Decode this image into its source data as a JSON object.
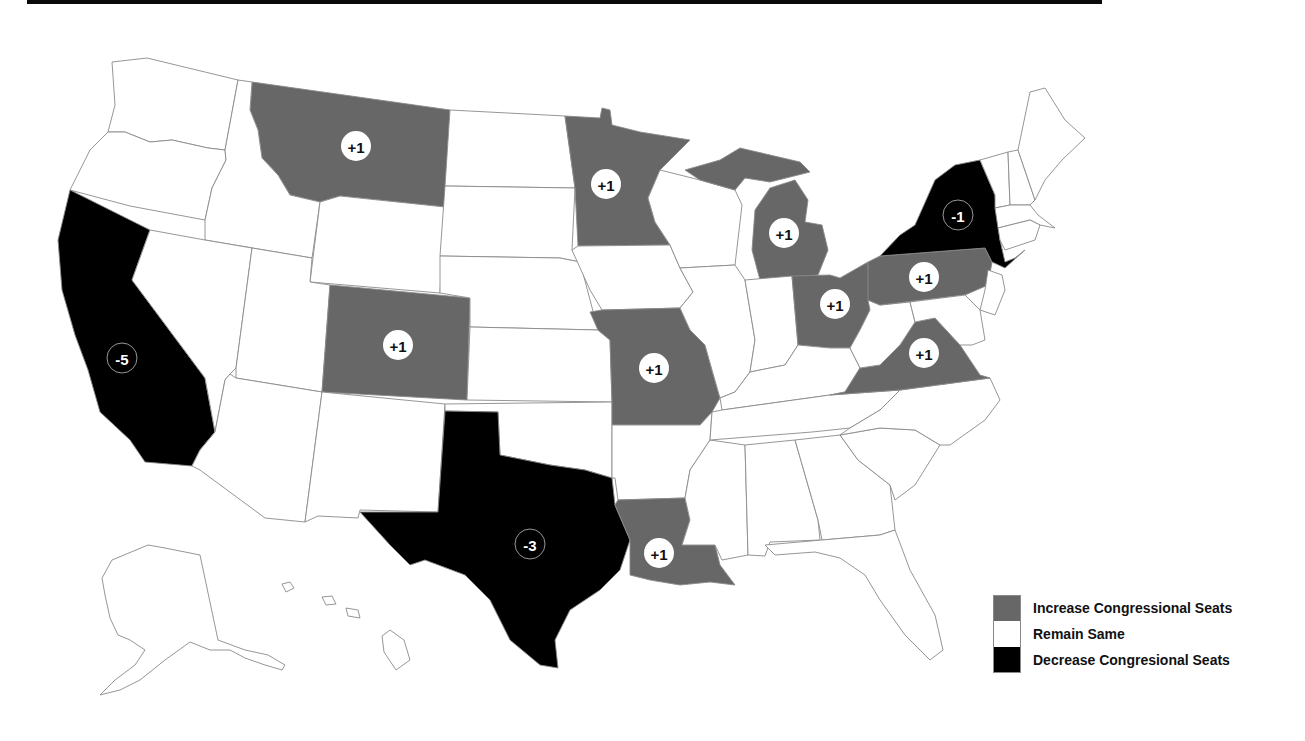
{
  "colors": {
    "increase": "#676767",
    "remain": "#ffffff",
    "decrease": "#000000",
    "border": "#8a8a8a",
    "top_bar": "#0a0a0a"
  },
  "legend": [
    {
      "key": "increase",
      "label": "Increase Congressional Seats",
      "color": "#676767"
    },
    {
      "key": "remain",
      "label": "Remain Same",
      "color": "#ffffff"
    },
    {
      "key": "decrease",
      "label": "Decrease Congresional Seats",
      "color": "#000000"
    }
  ],
  "states": {
    "montana": {
      "status": "increase",
      "label": "+1",
      "x": 356,
      "y": 146
    },
    "minnesota": {
      "status": "increase",
      "label": "+1",
      "x": 606,
      "y": 184
    },
    "michigan": {
      "status": "increase",
      "label": "+1",
      "x": 784,
      "y": 233
    },
    "new_york": {
      "status": "decrease",
      "label": "-1",
      "x": 958,
      "y": 215
    },
    "pennsylvania": {
      "status": "increase",
      "label": "+1",
      "x": 924,
      "y": 277
    },
    "ohio": {
      "status": "increase",
      "label": "+1",
      "x": 835,
      "y": 304
    },
    "virginia": {
      "status": "increase",
      "label": "+1",
      "x": 924,
      "y": 353
    },
    "colorado": {
      "status": "increase",
      "label": "+1",
      "x": 398,
      "y": 345
    },
    "missouri": {
      "status": "increase",
      "label": "+1",
      "x": 654,
      "y": 368
    },
    "california": {
      "status": "decrease",
      "label": "-5",
      "x": 122,
      "y": 358
    },
    "texas": {
      "status": "decrease",
      "label": "-3",
      "x": 530,
      "y": 544
    },
    "louisiana": {
      "status": "increase",
      "label": "+1",
      "x": 659,
      "y": 553
    }
  }
}
